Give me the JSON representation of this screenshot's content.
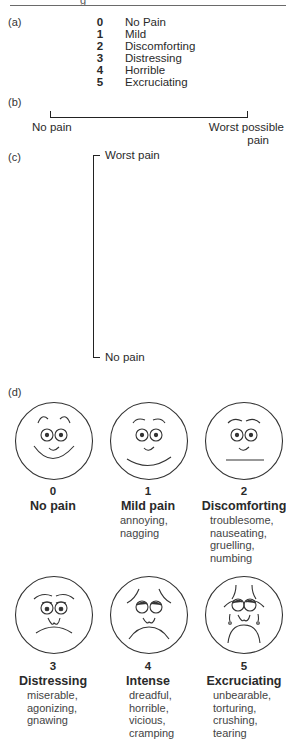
{
  "header": {
    "fragment": "g"
  },
  "section_a": {
    "label": "(a)",
    "items": [
      {
        "value": "0",
        "text": "No Pain"
      },
      {
        "value": "1",
        "text": "Mild"
      },
      {
        "value": "2",
        "text": "Discomforting"
      },
      {
        "value": "3",
        "text": "Distressing"
      },
      {
        "value": "4",
        "text": "Horrible"
      },
      {
        "value": "5",
        "text": "Excruciating"
      }
    ]
  },
  "section_b": {
    "label": "(b)",
    "left_anchor": "No pain",
    "right_anchor_line1": "Worst possible",
    "right_anchor_line2": "pain"
  },
  "section_c": {
    "label": "(c)",
    "top_anchor": "Worst pain",
    "bottom_anchor": "No pain"
  },
  "section_d": {
    "label": "(d)",
    "faces": [
      {
        "value": "0",
        "title": "No pain",
        "descriptors": []
      },
      {
        "value": "1",
        "title": "Mild pain",
        "descriptors": [
          "annoying,",
          "nagging"
        ]
      },
      {
        "value": "2",
        "title": "Discomforting",
        "descriptors": [
          "troublesome,",
          "nauseating,",
          "gruelling,",
          "numbing"
        ]
      },
      {
        "value": "3",
        "title": "Distressing",
        "descriptors": [
          "miserable,",
          "agonizing,",
          "gnawing"
        ]
      },
      {
        "value": "4",
        "title": "Intense",
        "descriptors": [
          "dreadful,",
          "horrible,",
          "vicious,",
          "cramping"
        ]
      },
      {
        "value": "5",
        "title": "Excruciating",
        "descriptors": [
          "unbearable,",
          "torturing,",
          "crushing,",
          "tearing"
        ]
      }
    ]
  }
}
